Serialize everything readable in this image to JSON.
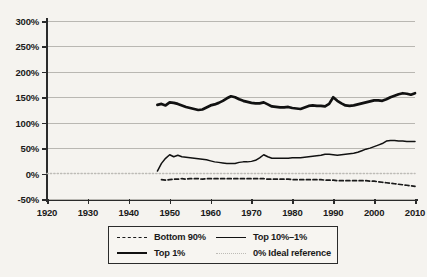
{
  "chart_data": {
    "type": "line",
    "title": "",
    "subtitle": "",
    "xlabel": "",
    "ylabel": "",
    "xlim": [
      1920,
      2010
    ],
    "ylim": [
      -50,
      300
    ],
    "y_tick_labels": [
      "300%",
      "250%",
      "200%",
      "150%",
      "100%",
      "50%",
      "0%",
      "-50%"
    ],
    "y_tick_values": [
      300,
      250,
      200,
      150,
      100,
      50,
      0,
      -50
    ],
    "x_tick_labels": [
      "1920",
      "1930",
      "1940",
      "1950",
      "1960",
      "1970",
      "1980",
      "1990",
      "2000",
      "2010"
    ],
    "x_tick_values": [
      1920,
      1930,
      1940,
      1950,
      1960,
      1970,
      1980,
      1990,
      2000,
      2010
    ],
    "grid": "horizontal",
    "legend_position": "bottom",
    "series": [
      {
        "name": "Bottom 90%",
        "style": "dashed",
        "color": "#1a1a1a",
        "x": [
          1948,
          1949,
          1950,
          1951,
          1952,
          1953,
          1954,
          1955,
          1956,
          1957,
          1958,
          1959,
          1960,
          1961,
          1962,
          1963,
          1964,
          1965,
          1966,
          1967,
          1968,
          1969,
          1970,
          1971,
          1972,
          1973,
          1974,
          1975,
          1976,
          1977,
          1978,
          1979,
          1980,
          1981,
          1982,
          1983,
          1984,
          1985,
          1986,
          1987,
          1988,
          1989,
          1990,
          1991,
          1992,
          1993,
          1994,
          1995,
          1996,
          1997,
          1998,
          1999,
          2000,
          2001,
          2002,
          2003,
          2004,
          2005,
          2006,
          2007,
          2008,
          2009,
          2010
        ],
        "values": [
          -12,
          -13,
          -12,
          -11,
          -11,
          -10,
          -11,
          -10,
          -10,
          -10,
          -11,
          -10,
          -10,
          -10,
          -10,
          -10,
          -10,
          -10,
          -10,
          -10,
          -10,
          -10,
          -10,
          -10,
          -10,
          -10,
          -11,
          -11,
          -11,
          -11,
          -11,
          -11,
          -12,
          -12,
          -12,
          -12,
          -12,
          -12,
          -12,
          -12,
          -13,
          -13,
          -13,
          -14,
          -14,
          -14,
          -14,
          -14,
          -14,
          -14,
          -14,
          -15,
          -15,
          -16,
          -17,
          -18,
          -19,
          -20,
          -21,
          -22,
          -23,
          -24,
          -25
        ]
      },
      {
        "name": "Top 10%-1%",
        "style": "thin-solid",
        "color": "#111111",
        "x": [
          1947,
          1948,
          1949,
          1950,
          1951,
          1952,
          1953,
          1954,
          1955,
          1956,
          1957,
          1958,
          1959,
          1960,
          1961,
          1962,
          1963,
          1964,
          1965,
          1966,
          1967,
          1968,
          1969,
          1970,
          1971,
          1972,
          1973,
          1974,
          1975,
          1976,
          1977,
          1978,
          1979,
          1980,
          1981,
          1982,
          1983,
          1984,
          1985,
          1986,
          1987,
          1988,
          1989,
          1990,
          1991,
          1992,
          1993,
          1994,
          1995,
          1996,
          1997,
          1998,
          1999,
          2000,
          2001,
          2002,
          2003,
          2004,
          2005,
          2006,
          2007,
          2008,
          2009,
          2010
        ],
        "values": [
          5,
          20,
          30,
          37,
          33,
          36,
          33,
          32,
          31,
          30,
          29,
          28,
          27,
          25,
          23,
          22,
          21,
          20,
          20,
          20,
          22,
          23,
          23,
          24,
          26,
          31,
          37,
          33,
          30,
          30,
          30,
          30,
          30,
          31,
          31,
          31,
          32,
          33,
          34,
          35,
          36,
          38,
          38,
          37,
          36,
          37,
          38,
          39,
          40,
          42,
          45,
          48,
          50,
          53,
          56,
          59,
          64,
          65,
          65,
          64,
          64,
          63,
          63,
          63
        ]
      },
      {
        "name": "Top 1%",
        "style": "thick-solid",
        "color": "#111111",
        "x": [
          1947,
          1948,
          1949,
          1950,
          1951,
          1952,
          1953,
          1954,
          1955,
          1956,
          1957,
          1958,
          1959,
          1960,
          1961,
          1962,
          1963,
          1964,
          1965,
          1966,
          1967,
          1968,
          1969,
          1970,
          1971,
          1972,
          1973,
          1974,
          1975,
          1976,
          1977,
          1978,
          1979,
          1980,
          1981,
          1982,
          1983,
          1984,
          1985,
          1986,
          1987,
          1988,
          1989,
          1990,
          1991,
          1992,
          1993,
          1994,
          1995,
          1996,
          1997,
          1998,
          1999,
          2000,
          2001,
          2002,
          2003,
          2004,
          2005,
          2006,
          2007,
          2008,
          2009,
          2010
        ],
        "values": [
          135,
          137,
          134,
          140,
          139,
          137,
          134,
          131,
          129,
          127,
          125,
          126,
          130,
          134,
          136,
          139,
          143,
          148,
          152,
          150,
          146,
          143,
          141,
          139,
          138,
          138,
          140,
          136,
          132,
          131,
          130,
          130,
          131,
          129,
          128,
          127,
          130,
          133,
          134,
          133,
          133,
          132,
          137,
          150,
          143,
          138,
          134,
          133,
          134,
          136,
          138,
          140,
          142,
          144,
          144,
          143,
          146,
          150,
          153,
          156,
          158,
          157,
          155,
          158
        ]
      },
      {
        "name": "0% Ideal reference",
        "style": "dotted",
        "color": "#bdbbb6",
        "x": [
          1920,
          2010
        ],
        "values": [
          0,
          0
        ]
      }
    ]
  },
  "legend": {
    "items": [
      {
        "label": "Bottom 90%",
        "swatch": "dashed"
      },
      {
        "label": "Top 10%–1%",
        "swatch": "thin-solid"
      },
      {
        "label": "Top 1%",
        "swatch": "thick-solid"
      },
      {
        "label": "0% Ideal reference",
        "swatch": "dotted"
      }
    ]
  }
}
